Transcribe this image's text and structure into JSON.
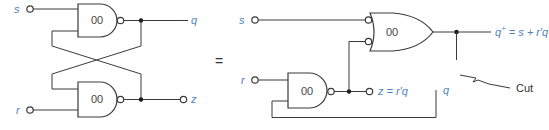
{
  "colors": {
    "wire": "#3a3a3a",
    "signal_label": "#4a7fc1",
    "text": "#333333"
  },
  "left_circuit": {
    "top_gate": {
      "type": "NAND",
      "label": "00"
    },
    "bottom_gate": {
      "type": "NAND",
      "label": "00"
    },
    "inputs": {
      "s": "s",
      "r": "r"
    },
    "outputs": {
      "q": "q",
      "z": "z"
    }
  },
  "equals_sign": "=",
  "right_circuit": {
    "or_gate": {
      "type": "OR (inverted inputs)",
      "label": "00"
    },
    "nand_gate": {
      "type": "NAND",
      "label": "00"
    },
    "inputs": {
      "s": "s",
      "r": "r"
    },
    "outputs": {
      "q_plus_main": "q",
      "q_plus_sup": "+",
      "q_plus_expr": " = s + r′q",
      "z": "z = r′q",
      "q_feedback": "q"
    },
    "cut_label": "Cut"
  }
}
